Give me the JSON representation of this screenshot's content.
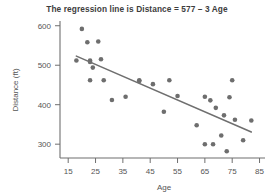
{
  "chart_data": {
    "type": "scatter",
    "title": "The regression line is Distance = 577 – 3 Age",
    "xlabel": "Age",
    "ylabel": "Distance (ft)",
    "xlim": [
      12,
      87
    ],
    "ylim": [
      265,
      612
    ],
    "xticks": [
      15,
      25,
      35,
      45,
      55,
      65,
      75,
      85
    ],
    "yticks": [
      300,
      400,
      500,
      600
    ],
    "grid": false,
    "legend": null,
    "point_color": "#6e6e6e",
    "line_color": "#6f6f6f",
    "regression": {
      "equation": "Distance = 577 – 3 Age",
      "intercept": 577,
      "slope": -3,
      "x_start": 18,
      "x_end": 82
    },
    "points": [
      {
        "x": 18,
        "y": 512
      },
      {
        "x": 20,
        "y": 592
      },
      {
        "x": 22,
        "y": 558
      },
      {
        "x": 23,
        "y": 512
      },
      {
        "x": 23,
        "y": 508
      },
      {
        "x": 23,
        "y": 462
      },
      {
        "x": 24,
        "y": 494
      },
      {
        "x": 26,
        "y": 560
      },
      {
        "x": 27,
        "y": 515
      },
      {
        "x": 28,
        "y": 462
      },
      {
        "x": 31,
        "y": 412
      },
      {
        "x": 36,
        "y": 420
      },
      {
        "x": 41,
        "y": 462
      },
      {
        "x": 41,
        "y": 460
      },
      {
        "x": 46,
        "y": 452
      },
      {
        "x": 50,
        "y": 382
      },
      {
        "x": 52,
        "y": 462
      },
      {
        "x": 55,
        "y": 422
      },
      {
        "x": 62,
        "y": 348
      },
      {
        "x": 65,
        "y": 420
      },
      {
        "x": 65,
        "y": 300
      },
      {
        "x": 67,
        "y": 411
      },
      {
        "x": 68,
        "y": 300
      },
      {
        "x": 69,
        "y": 392
      },
      {
        "x": 71,
        "y": 322
      },
      {
        "x": 72,
        "y": 373
      },
      {
        "x": 73,
        "y": 282
      },
      {
        "x": 74,
        "y": 419
      },
      {
        "x": 75,
        "y": 462
      },
      {
        "x": 76,
        "y": 362
      },
      {
        "x": 79,
        "y": 310
      },
      {
        "x": 82,
        "y": 360
      }
    ]
  }
}
